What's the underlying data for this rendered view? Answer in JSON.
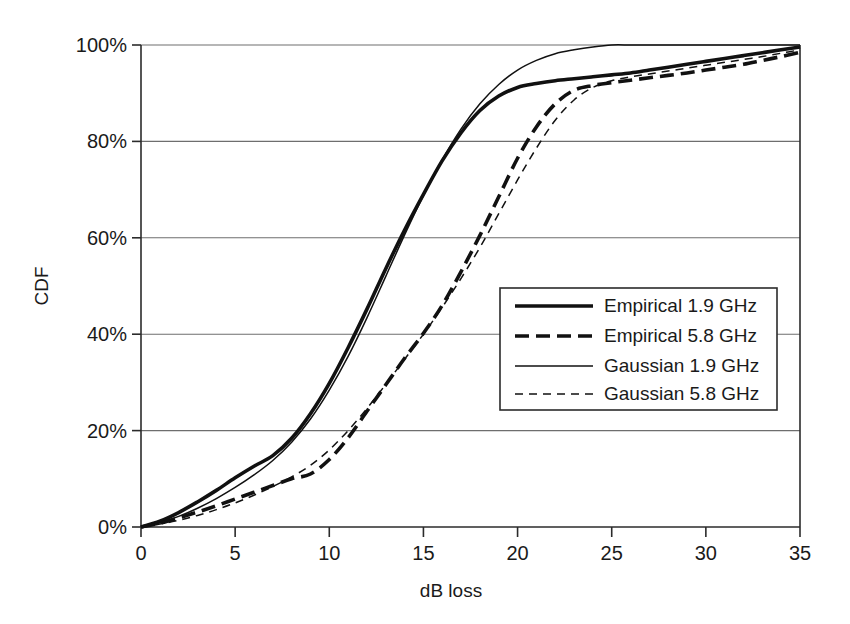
{
  "chart_data": {
    "type": "line",
    "title": "",
    "xlabel": "dB loss",
    "ylabel": "CDF",
    "xlim": [
      0,
      35
    ],
    "ylim": [
      0,
      100
    ],
    "xticks": [
      "0",
      "5",
      "10",
      "15",
      "20",
      "25",
      "30",
      "35"
    ],
    "xtick_values": [
      0,
      5,
      10,
      15,
      20,
      25,
      30,
      35
    ],
    "yticks": [
      "0%",
      "20%",
      "40%",
      "60%",
      "80%",
      "100%"
    ],
    "ytick_values": [
      0,
      20,
      40,
      60,
      80,
      100
    ],
    "grid": "horizontal",
    "legend_position": "center-right",
    "series": [
      {
        "name": "Empirical 1.9 GHz",
        "style": "solid",
        "width": "thick",
        "color": "#111111",
        "x": [
          0,
          1,
          2,
          3,
          4,
          5,
          6,
          7,
          8,
          9,
          10,
          11,
          12,
          13,
          14,
          15,
          16,
          17,
          18,
          19,
          20,
          21,
          22,
          23,
          24,
          25,
          26,
          27,
          28,
          29,
          30,
          31,
          32,
          33,
          34,
          35
        ],
        "y": [
          0,
          1.2,
          3.0,
          5.2,
          7.6,
          10.2,
          12.6,
          14.8,
          18.4,
          23.5,
          29.8,
          37.2,
          45.2,
          53.6,
          61.6,
          69.0,
          76.0,
          81.8,
          86.4,
          89.4,
          91.2,
          92.0,
          92.6,
          93.0,
          93.4,
          93.8,
          94.2,
          94.8,
          95.4,
          96.0,
          96.6,
          97.2,
          97.8,
          98.4,
          99.0,
          99.6
        ]
      },
      {
        "name": "Empirical 5.8 GHz",
        "style": "dashed",
        "width": "thick",
        "color": "#111111",
        "x": [
          0,
          1,
          2,
          3,
          4,
          5,
          6,
          7,
          8,
          9,
          10,
          11,
          12,
          13,
          14,
          15,
          16,
          17,
          18,
          19,
          20,
          21,
          22,
          23,
          24,
          25,
          26,
          27,
          28,
          29,
          30,
          31,
          32,
          33,
          34,
          35
        ],
        "y": [
          0,
          0.8,
          1.9,
          3.1,
          4.4,
          5.8,
          7.2,
          8.6,
          10.0,
          11.0,
          14.0,
          18.5,
          24.0,
          29.5,
          35.0,
          40.2,
          46.0,
          53.0,
          60.5,
          68.5,
          76.5,
          83.0,
          87.8,
          90.6,
          91.6,
          92.2,
          92.7,
          93.2,
          93.7,
          94.2,
          94.8,
          95.4,
          96.0,
          96.8,
          97.6,
          98.5
        ]
      },
      {
        "name": "Gaussian 1.9 GHz",
        "style": "solid",
        "width": "thin",
        "color": "#111111",
        "x": [
          0,
          1,
          2,
          3,
          4,
          5,
          6,
          7,
          8,
          9,
          10,
          11,
          12,
          13,
          14,
          15,
          16,
          17,
          18,
          19,
          20,
          21,
          22,
          23,
          24,
          25,
          26,
          27,
          28,
          29,
          30,
          31,
          32,
          33,
          34,
          35
        ],
        "y": [
          0,
          0.9,
          2.2,
          3.9,
          5.9,
          8.2,
          10.8,
          13.8,
          17.6,
          22.4,
          28.4,
          35.4,
          43.4,
          52.0,
          60.6,
          68.8,
          76.2,
          82.6,
          87.8,
          91.8,
          94.8,
          96.8,
          98.2,
          99.0,
          99.6,
          100.0,
          100.0,
          100.0,
          100.0,
          100.0,
          100.0,
          100.0,
          100.0,
          100.0,
          100.0,
          100.0
        ]
      },
      {
        "name": "Gaussian 5.8 GHz",
        "style": "dashed",
        "width": "thin",
        "color": "#111111",
        "x": [
          0,
          1,
          2,
          3,
          4,
          5,
          6,
          7,
          8,
          9,
          10,
          11,
          12,
          13,
          14,
          15,
          16,
          17,
          18,
          19,
          20,
          21,
          22,
          23,
          24,
          25,
          26,
          27,
          28,
          29,
          30,
          31,
          32,
          33,
          34,
          35
        ],
        "y": [
          0,
          0.6,
          1.4,
          2.4,
          3.6,
          5.0,
          6.6,
          8.4,
          10.4,
          12.8,
          16.0,
          20.0,
          24.6,
          29.6,
          34.8,
          40.0,
          45.6,
          51.6,
          58.0,
          65.0,
          72.0,
          78.6,
          84.4,
          88.6,
          91.2,
          92.6,
          93.4,
          94.0,
          94.6,
          95.2,
          95.8,
          96.4,
          97.0,
          97.6,
          98.3,
          99.0
        ]
      }
    ]
  },
  "legend": {
    "items": [
      {
        "label": "Empirical 1.9 GHz"
      },
      {
        "label": "Empirical 5.8 GHz"
      },
      {
        "label": "Gaussian 1.9 GHz"
      },
      {
        "label": "Gaussian 5.8 GHz"
      }
    ]
  },
  "colors": {
    "line": "#111111",
    "axis": "#2b2b2b",
    "grid": "#6e6e6e",
    "background": "#ffffff"
  }
}
